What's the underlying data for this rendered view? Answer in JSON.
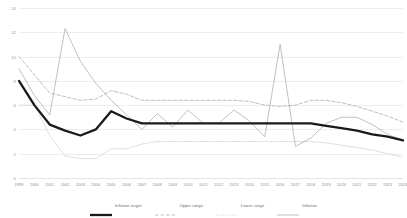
{
  "chart_data": {
    "type": "line",
    "title": "",
    "xlabel": "",
    "ylabel": "",
    "ylim": [
      0,
      14
    ],
    "yticks": [
      0,
      2,
      4,
      6,
      8,
      10,
      12,
      14
    ],
    "grid": true,
    "legend_position": "bottom",
    "categories": [
      "1999",
      "2000",
      "2001",
      "2002",
      "2003",
      "2004",
      "2005",
      "2006",
      "2007",
      "2008",
      "2009",
      "2010",
      "2011",
      "2012",
      "2013",
      "2014",
      "2015",
      "2016",
      "2017",
      "2018",
      "2019",
      "2020",
      "2021",
      "2022",
      "2023",
      "2024"
    ],
    "series": [
      {
        "name": "Inflation target",
        "color": "#1a1a1a",
        "style": "solid-thick",
        "values": [
          8.0,
          6.0,
          4.4,
          3.9,
          3.5,
          4.0,
          5.5,
          4.9,
          4.5,
          4.5,
          4.5,
          4.5,
          4.5,
          4.5,
          4.5,
          4.5,
          4.5,
          4.5,
          4.5,
          4.5,
          4.3,
          4.1,
          3.9,
          3.6,
          3.4,
          3.1
        ]
      },
      {
        "name": "Upper range",
        "color": "#b3b3b3",
        "style": "dashed",
        "values": [
          10.0,
          8.5,
          7.0,
          6.7,
          6.4,
          6.5,
          7.2,
          6.9,
          6.4,
          6.4,
          6.4,
          6.4,
          6.4,
          6.4,
          6.4,
          6.3,
          6.0,
          5.9,
          6.0,
          6.4,
          6.4,
          6.2,
          5.9,
          5.5,
          5.1,
          4.6
        ]
      },
      {
        "name": "Lower range",
        "color": "#d0d0d0",
        "style": "dotted",
        "values": [
          6.0,
          6.0,
          3.5,
          1.8,
          1.6,
          1.6,
          2.4,
          2.4,
          2.8,
          3.0,
          3.0,
          3.0,
          3.0,
          3.0,
          3.0,
          3.0,
          3.0,
          3.0,
          3.0,
          3.0,
          2.9,
          2.7,
          2.5,
          2.3,
          2.0,
          1.7
        ]
      },
      {
        "name": "Inflation",
        "color": "#a6a6a6",
        "style": "solid-thin",
        "values": [
          9.0,
          6.8,
          5.2,
          12.3,
          9.6,
          7.8,
          6.4,
          5.2,
          4.0,
          5.3,
          4.2,
          5.6,
          4.5,
          4.5,
          5.6,
          4.7,
          3.4,
          11.0,
          2.6,
          3.3,
          4.5,
          5.0,
          5.0,
          4.4,
          3.6,
          3.1
        ]
      }
    ]
  },
  "legend": {
    "items": [
      {
        "label": "Inflation target"
      },
      {
        "label": "Upper range"
      },
      {
        "label": "Lower range"
      },
      {
        "label": "Inflation"
      }
    ]
  }
}
